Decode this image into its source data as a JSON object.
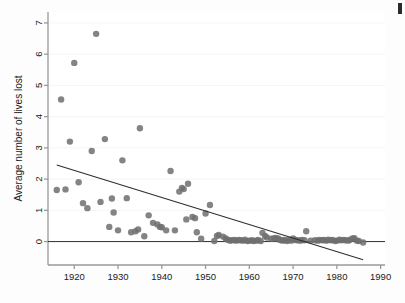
{
  "figure": {
    "background_color": "#fefefe",
    "marker_color": "#6e6e6e",
    "line_color": "#2e2e2e",
    "axis_color": "#9a9a9a",
    "grid_color": "#f2f2f2",
    "corner_artifact_color": "#2b2b2b"
  },
  "chart_data": {
    "type": "scatter",
    "title": "",
    "subtitle": "",
    "xlabel": "",
    "ylabel": "Average number of lives lost",
    "xlim": [
      1914,
      1991
    ],
    "ylim": [
      -0.75,
      7.35
    ],
    "xticks": [
      1920,
      1930,
      1940,
      1950,
      1960,
      1970,
      1980,
      1990
    ],
    "xtick_labels": [
      "1920",
      "1930",
      "1940",
      "1950",
      "1960",
      "1970",
      "1980",
      "1990"
    ],
    "yticks": [
      0,
      1,
      2,
      3,
      4,
      5,
      6,
      7
    ],
    "ytick_labels": [
      "0",
      "1",
      "2",
      "3",
      "4",
      "5",
      "6",
      "7"
    ],
    "grid": false,
    "legend": null,
    "legend_position": "none",
    "marker": "circle",
    "marker_size": 3.2,
    "x": [
      1916,
      1917,
      1918,
      1919,
      1920,
      1921,
      1922,
      1923,
      1924,
      1925,
      1926,
      1927,
      1928,
      1928.6,
      1929,
      1930,
      1931,
      1932,
      1933,
      1934,
      1934.6,
      1935,
      1936,
      1937,
      1938,
      1939,
      1939.6,
      1940,
      1941,
      1942,
      1943,
      1944,
      1944.6,
      1945,
      1945.6,
      1946,
      1947,
      1947.6,
      1948,
      1949,
      1950,
      1951,
      1952,
      1952.6,
      1953,
      1954,
      1954.6,
      1955,
      1955.6,
      1956,
      1956.6,
      1957,
      1957.6,
      1958,
      1958.6,
      1959,
      1959.6,
      1960,
      1960.6,
      1961,
      1961.6,
      1962,
      1962.6,
      1963,
      1963.6,
      1964,
      1965,
      1965.6,
      1966,
      1966.6,
      1967,
      1967.6,
      1968,
      1968.6,
      1969,
      1969.6,
      1970,
      1970.6,
      1971,
      1971.6,
      1972,
      1972.6,
      1973,
      1974,
      1975,
      1975.6,
      1976,
      1976.6,
      1977,
      1977.6,
      1978,
      1978.6,
      1979,
      1979.6,
      1980,
      1980.6,
      1981,
      1981.6,
      1982,
      1982.6,
      1983,
      1983.6,
      1984,
      1984.6,
      1985,
      1986
    ],
    "y": [
      1.65,
      4.55,
      1.67,
      3.2,
      5.72,
      1.9,
      1.23,
      1.07,
      2.9,
      6.65,
      1.27,
      3.28,
      0.47,
      1.38,
      0.93,
      0.36,
      2.6,
      1.39,
      0.3,
      0.33,
      0.39,
      3.63,
      0.17,
      0.84,
      0.6,
      0.55,
      0.47,
      0.46,
      0.36,
      2.26,
      0.36,
      1.6,
      1.72,
      1.68,
      0.71,
      1.85,
      0.79,
      0.75,
      0.3,
      0.09,
      0.9,
      1.17,
      0.02,
      0.18,
      0.21,
      0.16,
      0.1,
      0.06,
      0.03,
      0.04,
      0.05,
      0.03,
      0.05,
      0.04,
      0.03,
      0.06,
      0.02,
      0.03,
      0.04,
      0.02,
      0.03,
      0.05,
      0.02,
      0.28,
      0.18,
      0.13,
      0.09,
      0.1,
      0.12,
      0.1,
      0.05,
      0.03,
      0.05,
      0.02,
      0.05,
      0.03,
      0.1,
      0.05,
      0.04,
      0.03,
      0.05,
      0.04,
      0.33,
      0.03,
      0.04,
      0.03,
      0.05,
      0.04,
      0.05,
      0.03,
      0.06,
      0.04,
      0.05,
      0.02,
      0.03,
      0.06,
      0.04,
      0.05,
      0.04,
      0.03,
      0.06,
      0.1,
      0.11,
      0.03,
      0.02,
      -0.03
    ],
    "trend_line": {
      "label": "fitted regression line",
      "x_start": 1916,
      "y_start": 2.45,
      "x_end": 1986,
      "y_end": -0.58
    },
    "reference_line": {
      "label": "zero reference line",
      "y": 0,
      "x_start": 1914,
      "x_end": 1991
    }
  }
}
